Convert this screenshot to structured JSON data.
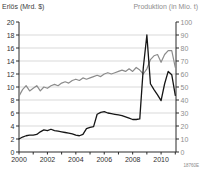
{
  "chart": {
    "left_axis_title": "Erlös (Mrd. $)",
    "right_axis_title": "Produktion (in Mio. t)",
    "footnote": "18760E"
  },
  "chart_data": {
    "type": "line",
    "title": "",
    "x": [
      2000.0,
      2000.25,
      2000.5,
      2000.75,
      2001.0,
      2001.25,
      2001.5,
      2001.75,
      2002.0,
      2002.25,
      2002.5,
      2002.75,
      2003.0,
      2003.25,
      2003.5,
      2003.75,
      2004.0,
      2004.25,
      2004.5,
      2004.75,
      2005.0,
      2005.25,
      2005.5,
      2005.75,
      2006.0,
      2006.25,
      2006.5,
      2006.75,
      2007.0,
      2007.25,
      2007.5,
      2007.75,
      2008.0,
      2008.25,
      2008.5,
      2008.75,
      2009.0,
      2009.25,
      2009.5,
      2009.75,
      2010.0,
      2010.25,
      2010.5,
      2010.75,
      2011.0
    ],
    "series": [
      {
        "name": "Erlös (Mrd. $)",
        "axis": "left",
        "color": "#161616",
        "width": 1.3,
        "values": [
          2.0,
          2.3,
          2.5,
          2.6,
          2.6,
          2.7,
          3.1,
          3.4,
          3.3,
          3.5,
          3.3,
          3.2,
          3.1,
          3.0,
          2.9,
          2.8,
          2.6,
          2.5,
          2.7,
          3.6,
          3.8,
          3.9,
          5.8,
          6.1,
          6.2,
          6.0,
          5.9,
          5.8,
          5.7,
          5.6,
          5.4,
          5.2,
          5.0,
          5.0,
          5.1,
          13.0,
          18.0,
          10.5,
          9.6,
          8.8,
          7.9,
          10.5,
          12.4,
          11.9,
          8.7
        ]
      },
      {
        "name": "Produktion (in Mio. t)",
        "axis": "right",
        "color": "#8c8c8c",
        "width": 1.2,
        "values": [
          43,
          48,
          51,
          47,
          49,
          51,
          47,
          50,
          49,
          51,
          52,
          51,
          53,
          54,
          53,
          55,
          56,
          55,
          57,
          56,
          57,
          58,
          59,
          58,
          60,
          61,
          60,
          61,
          62,
          63,
          62,
          64,
          62,
          65,
          63,
          60,
          64,
          71,
          74,
          75,
          69,
          75,
          78,
          78,
          65
        ]
      }
    ],
    "x_axis": {
      "min": 2000,
      "max": 2011.05,
      "minor_tick_step": 1,
      "label_step": 2,
      "tick_labels": [
        "2000",
        "2002",
        "2004",
        "2006",
        "2008",
        "2010"
      ]
    },
    "left_axis": {
      "label": "Erlös (Mrd. $)",
      "min": 0,
      "max": 20,
      "tick_step": 2,
      "ticks": [
        "0",
        "2",
        "4",
        "6",
        "8",
        "10",
        "12",
        "14",
        "16",
        "18",
        "20"
      ]
    },
    "right_axis": {
      "label": "Produktion (in Mio. t)",
      "min": 0,
      "max": 100,
      "tick_step": 10,
      "ticks": [
        "0",
        "10",
        "20",
        "30",
        "40",
        "50",
        "60",
        "70",
        "80",
        "90",
        "100"
      ]
    },
    "grid": true,
    "legend": "none",
    "colors": {
      "grid": "#c9c9c9",
      "axis": "#2a2a2a",
      "left_tick_text": "#2f2f2f",
      "right_tick_text": "#8e8e8e",
      "x_tick_text": "#2f2f2f"
    }
  }
}
